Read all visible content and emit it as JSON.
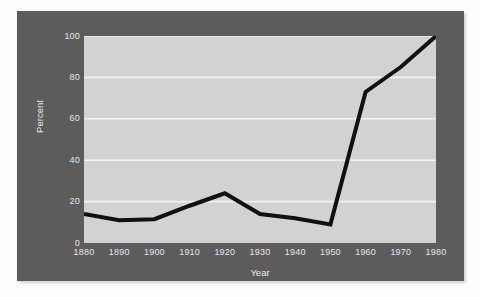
{
  "chart_data": {
    "type": "line",
    "title": "",
    "xlabel": "Year",
    "ylabel": "Percent",
    "xlim": [
      1880,
      1980
    ],
    "ylim": [
      0,
      100
    ],
    "grid": true,
    "legend": null,
    "x": [
      1880,
      1890,
      1900,
      1910,
      1920,
      1930,
      1940,
      1950,
      1960,
      1970,
      1980
    ],
    "xtick_labels": [
      "1880",
      "1890",
      "1900",
      "1910",
      "1920",
      "1930",
      "1940",
      "1950",
      "1960",
      "1970",
      "1980"
    ],
    "ytick_labels": [
      "0",
      "20",
      "40",
      "60",
      "80",
      "100"
    ],
    "ytick_values": [
      0,
      20,
      40,
      60,
      80,
      100
    ],
    "series": [
      {
        "name": "Percent",
        "color": "#111111",
        "line_width": 4,
        "values": [
          14,
          11,
          11.5,
          18,
          24,
          14,
          12,
          9,
          73,
          85,
          100
        ]
      }
    ]
  },
  "figure": {
    "panel_color": "#5c5c5c",
    "plot_background": "#d2d2d2",
    "gridline_color": "#f2f2f2",
    "tick_text_color": "#e6e6e6",
    "page_background": "#ffffff"
  }
}
